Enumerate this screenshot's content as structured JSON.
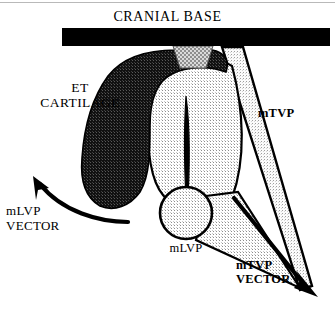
{
  "figure": {
    "kind": "anatomical-diagram",
    "width": 335,
    "height": 318,
    "background_color": "#ffffff"
  },
  "title": {
    "text": "CRANIAL BASE"
  },
  "labels": {
    "et_cartilage": "ET\nCARTILAGE",
    "mlvp_vector": "mLVP\nVECTOR",
    "mlvp": "mLVP",
    "mtvp": "mTVP",
    "mtvp_vector": "mTVP\nVECTOR"
  },
  "colors": {
    "outline": "#000000",
    "cranial_base_bar": "#000000",
    "cartilage_dark_fill": "#1a1a1a",
    "cartilage_stipple_dot": "#000000",
    "torus_light_fill": "#eeeeee",
    "mtvp_band_fill": "#e2e2e2",
    "midgray_stipple_fill": "#9a9a9a",
    "lumen_slit": "#000000",
    "top_rule": "#b9b9b9",
    "text": "#000000"
  },
  "shapes": {
    "cranial_base_bar": {
      "x": 62,
      "y": 28,
      "width": 268,
      "height": 18
    },
    "mlvp_circle": {
      "cx": 186,
      "cy": 213,
      "r": 26
    },
    "lumen_slit": {
      "x": 182,
      "y": 96,
      "length": 120
    },
    "mtvp_band": {
      "origin_x": 222,
      "origin_y": 47,
      "tip_x": 310,
      "tip_y": 288
    }
  },
  "arrows": {
    "mlvp": {
      "type": "curved",
      "start_x": 128,
      "start_y": 222,
      "end_x": 33,
      "end_y": 180,
      "direction": "up-left"
    },
    "mtvp": {
      "type": "straight",
      "start_x": 232,
      "start_y": 196,
      "end_x": 318,
      "end_y": 297,
      "direction": "down-right"
    }
  }
}
